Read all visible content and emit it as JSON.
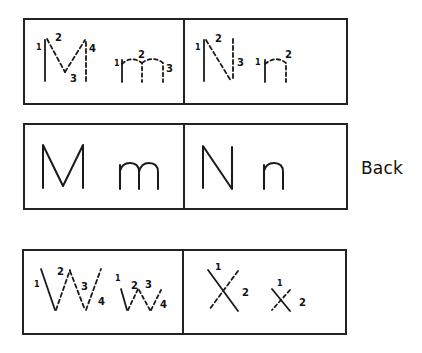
{
  "cards": {
    "row1": {
      "left": {
        "letters": "M m",
        "type": "stroke-order",
        "upper_strokes": [
          "1",
          "2",
          "3",
          "4"
        ],
        "lower_strokes": [
          "1",
          "2",
          "3"
        ]
      },
      "right": {
        "letters": "N n",
        "type": "stroke-order",
        "upper_strokes": [
          "1",
          "2",
          "3"
        ],
        "lower_strokes": [
          "1",
          "2"
        ]
      }
    },
    "row2": {
      "left": {
        "upper": "M",
        "lower": "m"
      },
      "right": {
        "upper": "N",
        "lower": "n"
      }
    },
    "row3": {
      "left": {
        "letters": "W w",
        "type": "stroke-order",
        "upper_strokes": [
          "1",
          "2",
          "3",
          "4"
        ],
        "lower_strokes": [
          "1",
          "2",
          "3",
          "4"
        ]
      },
      "right": {
        "letters": "X x",
        "type": "stroke-order",
        "upper_strokes": [
          "1",
          "2"
        ],
        "lower_strokes": [
          "1",
          "2"
        ]
      }
    }
  },
  "labels": {
    "back": "Back"
  },
  "colors": {
    "ink": "#1a1a1a",
    "background": "#ffffff"
  }
}
